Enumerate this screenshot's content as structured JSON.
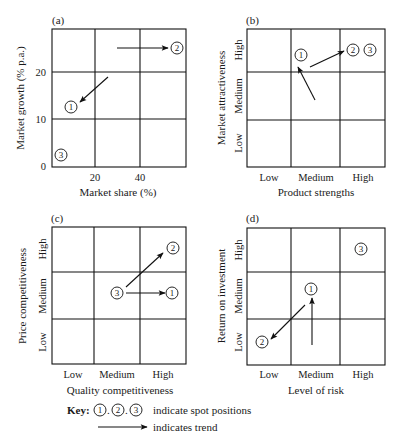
{
  "figure": {
    "key": {
      "label": "Key:",
      "spots": [
        "1",
        "2",
        "3"
      ],
      "separator": ".",
      "spots_text": "indicate spot positions",
      "trend_text": "indicates trend"
    }
  },
  "chart_data": [
    {
      "id": "a",
      "panel_label": "(a)",
      "type": "scatter",
      "xlabel": "Market share (%)",
      "ylabel": "Market growth (% p.a.)",
      "x_ticks": [
        "20",
        "40"
      ],
      "y_ticks": [
        "0",
        "10",
        "20"
      ],
      "xlim": [
        0,
        60
      ],
      "ylim": [
        0,
        30
      ],
      "grid": true,
      "box": {
        "x": 52,
        "y": 29,
        "w": 134,
        "h": 138
      },
      "vlines": [
        95,
        140
      ],
      "hlines": [
        72,
        119
      ],
      "x_tick_pos": [
        95,
        140
      ],
      "y_tick_pos": [
        165,
        119,
        72
      ],
      "spots": [
        {
          "label": "1",
          "x": 71,
          "y": 107,
          "approx_value": {
            "share": 7,
            "growth": 13
          }
        },
        {
          "label": "2",
          "x": 177,
          "y": 48,
          "approx_value": {
            "share": 57,
            "growth": 26
          }
        },
        {
          "label": "3",
          "x": 61,
          "y": 155,
          "approx_value": {
            "share": 3,
            "growth": 2
          }
        }
      ],
      "trends": [
        {
          "to_spot": "1",
          "x1": 108,
          "y1": 77,
          "x2": 80,
          "y2": 102
        },
        {
          "to_spot": "2",
          "x1": 117,
          "y1": 48,
          "x2": 168,
          "y2": 48
        }
      ]
    },
    {
      "id": "b",
      "panel_label": "(b)",
      "type": "scatter",
      "xlabel": "Product strengths",
      "ylabel": "Market attractiveness",
      "x_categories": [
        "Low",
        "Medium",
        "High"
      ],
      "y_categories": [
        "Low",
        "Medium",
        "High"
      ],
      "grid": true,
      "box": {
        "x": 247,
        "y": 29,
        "w": 138,
        "h": 138
      },
      "vlines": [
        291,
        340
      ],
      "hlines": [
        72,
        120
      ],
      "spots": [
        {
          "label": "1",
          "x": 301,
          "y": 55,
          "category": {
            "x": "Medium",
            "y": "High"
          }
        },
        {
          "label": "2",
          "x": 353,
          "y": 50,
          "category": {
            "x": "High",
            "y": "High"
          }
        },
        {
          "label": "3",
          "x": 370,
          "y": 50,
          "category": {
            "x": "High",
            "y": "High"
          }
        }
      ],
      "trends": [
        {
          "to_spot": "1",
          "x1": 315,
          "y1": 100,
          "x2": 298,
          "y2": 67
        },
        {
          "to_spot": "2",
          "x1": 310,
          "y1": 67,
          "x2": 344,
          "y2": 51
        }
      ]
    },
    {
      "id": "c",
      "panel_label": "(c)",
      "type": "scatter",
      "xlabel": "Quality competitiveness",
      "ylabel": "Price competitiveness",
      "x_categories": [
        "Low",
        "Medium",
        "High"
      ],
      "y_categories": [
        "Low",
        "Medium",
        "High"
      ],
      "grid": true,
      "box": {
        "x": 52,
        "y": 227,
        "w": 134,
        "h": 137
      },
      "vlines": [
        94,
        140
      ],
      "hlines": [
        272,
        319
      ],
      "spots": [
        {
          "label": "1",
          "x": 172,
          "y": 293,
          "category": {
            "x": "High",
            "y": "Medium"
          }
        },
        {
          "label": "2",
          "x": 173,
          "y": 248,
          "category": {
            "x": "High",
            "y": "High"
          }
        },
        {
          "label": "3",
          "x": 117,
          "y": 293,
          "category": {
            "x": "Medium",
            "y": "Medium"
          }
        }
      ],
      "trends": [
        {
          "to_spot": "2",
          "x1": 126,
          "y1": 287,
          "x2": 163,
          "y2": 253
        },
        {
          "to_spot": "1",
          "x1": 126,
          "y1": 293,
          "x2": 165,
          "y2": 293
        }
      ]
    },
    {
      "id": "d",
      "panel_label": "(d)",
      "type": "scatter",
      "xlabel": "Level of risk",
      "ylabel": "Return on investment",
      "x_categories": [
        "Low",
        "Medium",
        "High"
      ],
      "y_categories": [
        "Low",
        "Medium",
        "High"
      ],
      "grid": true,
      "box": {
        "x": 247,
        "y": 228,
        "w": 138,
        "h": 137
      },
      "vlines": [
        291,
        340
      ],
      "hlines": [
        272,
        319
      ],
      "spots": [
        {
          "label": "1",
          "x": 311,
          "y": 289,
          "category": {
            "x": "Medium",
            "y": "Medium"
          }
        },
        {
          "label": "2",
          "x": 262,
          "y": 342,
          "category": {
            "x": "Low",
            "y": "Low"
          }
        },
        {
          "label": "3",
          "x": 361,
          "y": 249,
          "category": {
            "x": "High",
            "y": "High"
          }
        }
      ],
      "trends": [
        {
          "to_spot": "1",
          "x1": 312,
          "y1": 345,
          "x2": 312,
          "y2": 298
        },
        {
          "to_spot": "2",
          "x1": 305,
          "y1": 305,
          "x2": 271,
          "y2": 339
        }
      ]
    }
  ]
}
